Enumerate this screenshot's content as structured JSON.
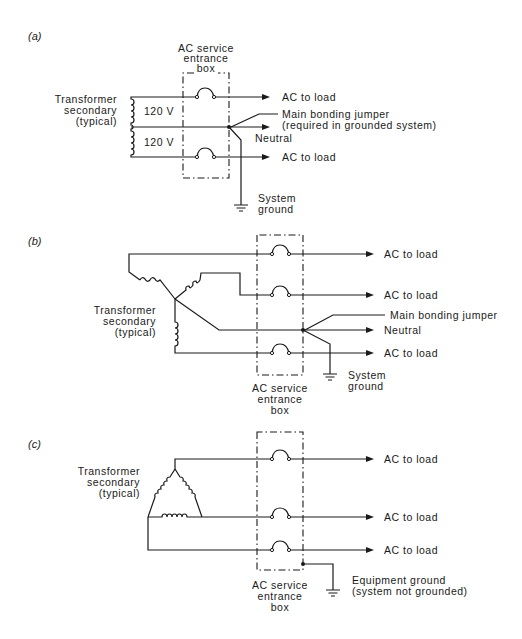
{
  "panels": [
    {
      "id": "a",
      "label": "(a)",
      "box_label": [
        "AC service",
        "entrance",
        "box"
      ],
      "transformer_label": [
        "Transformer",
        "secondary",
        "(typical)"
      ],
      "voltages": [
        "120 V",
        "120 V"
      ],
      "outputs": [
        "AC to load",
        "AC to load"
      ],
      "neutral_label": "Neutral",
      "jumper_label": [
        "Main bonding jumper",
        "(required in grounded system)"
      ],
      "ground_label": [
        "System",
        "ground"
      ]
    },
    {
      "id": "b",
      "label": "(b)",
      "box_label": [
        "AC service",
        "entrance",
        "box"
      ],
      "transformer_label": [
        "Transformer",
        "secondary",
        "(typical)"
      ],
      "outputs": [
        "AC to load",
        "AC to load",
        "AC to load"
      ],
      "neutral_label": "Neutral",
      "jumper_label": [
        "Main bonding jumper"
      ],
      "ground_label": [
        "System",
        "ground"
      ]
    },
    {
      "id": "c",
      "label": "(c)",
      "box_label": [
        "AC service",
        "entrance",
        "box"
      ],
      "transformer_label": [
        "Transformer",
        "secondary",
        "(typical)"
      ],
      "outputs": [
        "AC to load",
        "AC to load",
        "AC to load"
      ],
      "ground_label": [
        "Equipment ground",
        "(system not grounded)"
      ]
    }
  ]
}
